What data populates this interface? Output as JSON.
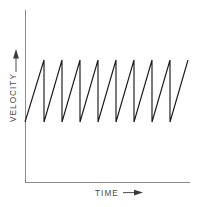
{
  "figure": {
    "title": "",
    "background_color": "#ffffff",
    "width": 207,
    "height": 207
  },
  "axes": {
    "x_label": "TIME",
    "y_label": "VELOCITY",
    "x_arrow_icon": "arrow-right-icon",
    "y_arrow_icon": "arrow-up-icon",
    "axis_color": "#8a8a8a",
    "label_color": "#4a4a4a",
    "origin": {
      "x": 25,
      "y": 182
    },
    "x_axis_end": {
      "x": 190,
      "y": 182
    },
    "y_axis_top": {
      "x": 25,
      "y": 10
    }
  },
  "chart_data": {
    "type": "line",
    "title": "",
    "xlabel": "TIME",
    "ylabel": "VELOCITY",
    "waveform": "sawtooth",
    "series": [
      {
        "name": "velocity",
        "color": "#1b1b1b",
        "cycles": 9,
        "peak_value": 1.0,
        "trough_value": 0.0,
        "start_value": 0.0,
        "points_px": [
          [
            25,
            122
          ],
          [
            44,
            60
          ],
          [
            44,
            122
          ],
          [
            62,
            60
          ],
          [
            62,
            122
          ],
          [
            80,
            60
          ],
          [
            80,
            122
          ],
          [
            98,
            60
          ],
          [
            98,
            122
          ],
          [
            116,
            60
          ],
          [
            116,
            122
          ],
          [
            134,
            60
          ],
          [
            134,
            122
          ],
          [
            152,
            60
          ],
          [
            152,
            122
          ],
          [
            170,
            60
          ],
          [
            170,
            122
          ],
          [
            188,
            60
          ]
        ],
        "x": [
          0,
          1,
          1,
          2,
          2,
          3,
          3,
          4,
          4,
          5,
          5,
          6,
          6,
          7,
          7,
          8,
          8,
          9
        ],
        "y": [
          0,
          1,
          0,
          1,
          0,
          1,
          0,
          1,
          0,
          1,
          0,
          1,
          0,
          1,
          0,
          1,
          0,
          1
        ]
      }
    ],
    "xlim": [
      0,
      9.05
    ],
    "ylim": [
      0,
      1.0
    ],
    "grid": false,
    "legend": null,
    "tick_labels": {
      "x": [],
      "y": []
    },
    "annotations": []
  }
}
